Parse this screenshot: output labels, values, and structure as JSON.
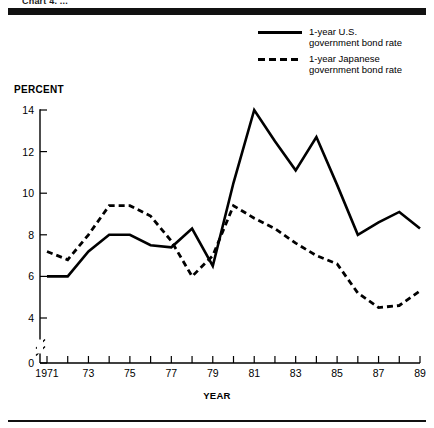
{
  "top_caption": "Chart 4. ...",
  "percent_axis_title": "PERCENT",
  "year_axis_title": "YEAR",
  "legend": {
    "items": [
      {
        "style": "solid",
        "label": "1-year U.S.\ngovernment bond rate"
      },
      {
        "style": "dashed",
        "label": "1-year Japanese\ngovernment bond rate"
      }
    ]
  },
  "chart_data": {
    "type": "line",
    "title": "",
    "xlabel": "YEAR",
    "ylabel": "PERCENT",
    "xlim": [
      1971,
      1989
    ],
    "ylim": [
      0,
      14
    ],
    "y_ticks": [
      0,
      4,
      6,
      8,
      10,
      12,
      14
    ],
    "y_tick_labels": [
      "0",
      "4",
      "6",
      "8",
      "10",
      "12",
      "14"
    ],
    "y_axis_break": true,
    "y_axis_break_between": [
      0,
      4
    ],
    "grid": false,
    "legend_position": "top-right",
    "x": [
      1971,
      1972,
      1973,
      1974,
      1975,
      1976,
      1977,
      1978,
      1979,
      1980,
      1981,
      1982,
      1983,
      1984,
      1985,
      1986,
      1987,
      1988,
      1989
    ],
    "x_tick_labels": [
      "1971",
      "",
      "73",
      "",
      "75",
      "",
      "77",
      "",
      "79",
      "",
      "81",
      "",
      "83",
      "",
      "85",
      "",
      "87",
      "",
      "89"
    ],
    "series": [
      {
        "name": "1-year U.S. government bond rate",
        "style": "solid",
        "values": [
          6.0,
          6.0,
          7.2,
          8.0,
          8.0,
          7.5,
          7.4,
          8.3,
          6.5,
          10.5,
          14.0,
          12.5,
          11.1,
          12.7,
          10.4,
          8.0,
          8.6,
          9.1,
          8.3
        ]
      },
      {
        "name": "1-year Japanese government bond rate",
        "style": "dashed",
        "values": [
          7.2,
          6.8,
          8.0,
          9.4,
          9.4,
          8.9,
          7.7,
          6.0,
          7.0,
          9.4,
          8.8,
          8.3,
          7.6,
          7.0,
          6.6,
          5.2,
          4.5,
          4.6,
          5.3
        ]
      }
    ]
  }
}
